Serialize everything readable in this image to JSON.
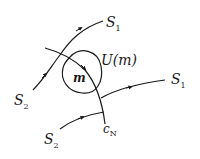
{
  "diagram": {
    "stroke_color": "#1a1a1a",
    "background": "#ffffff",
    "labels": {
      "s1_top": {
        "main": "S",
        "sub": "1"
      },
      "s1_right": {
        "main": "S",
        "sub": "1"
      },
      "s2_left": {
        "main": "S",
        "sub": "2"
      },
      "s2_bottom": {
        "main": "S",
        "sub": "2"
      },
      "neighborhood": "U(m)",
      "point": "m",
      "curve": {
        "main": "c",
        "sub": "N"
      }
    },
    "curves": [
      {
        "name": "upper-trajectory",
        "from": "S2",
        "to": "S1"
      },
      {
        "name": "lower-trajectory",
        "from": "S2",
        "to": "S1"
      },
      {
        "name": "curve-cN",
        "label": "cN"
      }
    ],
    "neighborhood": {
      "name": "U(m)",
      "shape": "closed-loop"
    }
  }
}
